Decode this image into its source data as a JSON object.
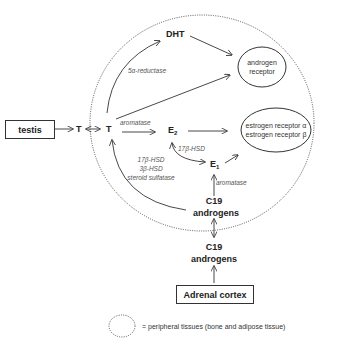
{
  "nodes": {
    "testis": "testis",
    "t_outside": "T",
    "t_inside": "T",
    "dht": "DHT",
    "e2_main": "E",
    "e2_sub": "2",
    "e1_main": "E",
    "e1_sub": "1",
    "c19_inner_line1": "C19",
    "c19_inner_line2": "androgens",
    "c19_outer_line1": "C19",
    "c19_outer_line2": "androgens",
    "adrenal": "Adrenal cortex"
  },
  "receptors": {
    "androgen_line1": "androgen",
    "androgen_line2": "receptor",
    "estrogen_line1": "estrogen receptor α",
    "estrogen_line2": "estrogen receptor β"
  },
  "enzymes": {
    "five_alpha": "5α-reductase",
    "aromatase_t": "aromatase",
    "hsd17_e": "17β-HSD",
    "aromatase_e1": "aromatase",
    "hsd17": "17β-HSD",
    "hsd3": "3β-HSD",
    "sulfatase": "steroid sulfatase"
  },
  "legend": {
    "text": "= peripheral tissues (bone and adipose tissue)"
  },
  "colors": {
    "line": "#333333",
    "dotted": "#555555",
    "enzyme_text": "#555555"
  }
}
